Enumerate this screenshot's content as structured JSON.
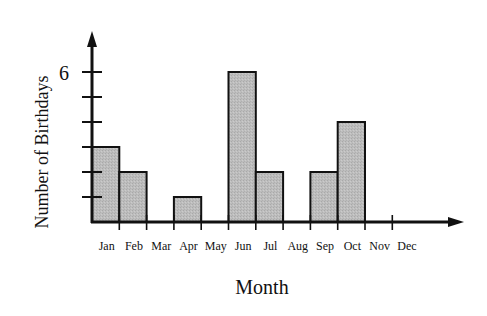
{
  "chart_data": {
    "type": "bar",
    "title": "",
    "xlabel": "Month",
    "ylabel": "Number of Birthdays",
    "categories": [
      "Jan",
      "Feb",
      "Mar",
      "Apr",
      "May",
      "Jun",
      "Jul",
      "Aug",
      "Sep",
      "Oct",
      "Nov",
      "Dec"
    ],
    "values": [
      3,
      2,
      0,
      1,
      0,
      6,
      2,
      0,
      2,
      4,
      0,
      0
    ],
    "y_tick_labels": [
      {
        "value": 6,
        "label": "6"
      }
    ],
    "y_ticks": [
      1,
      2,
      3,
      4,
      5,
      6
    ],
    "ylim": [
      0,
      7
    ],
    "grid": false,
    "legend": null,
    "bar_color": "#b8b8b8",
    "edge_color": "#111111"
  }
}
